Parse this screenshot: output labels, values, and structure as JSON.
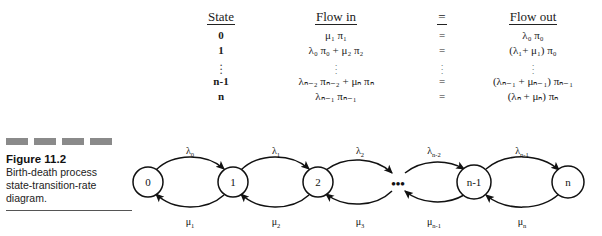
{
  "figure": {
    "number": "Figure 11.2",
    "caption_lines": [
      "Birth-death process",
      "state-transition-rate",
      "diagram."
    ],
    "dash_count": 4,
    "dash_color": "#8a8a8a"
  },
  "balance_table": {
    "headers": {
      "state": "State",
      "flow_in": "Flow in",
      "equals": "=",
      "flow_out": "Flow out"
    },
    "rows": [
      {
        "state": "0",
        "flow_in": "μ₁ π₁",
        "equals": "=",
        "flow_out": "λ₀ π₀"
      },
      {
        "state": "1",
        "flow_in": "λ₀ π₀ +  μ₂ π₂",
        "equals": "=",
        "flow_out": "(λ₁+ μ₁) π₀"
      },
      {
        "state": "⋮",
        "flow_in": "⋮",
        "equals": "⋮",
        "flow_out": "⋮"
      },
      {
        "state": "n-1",
        "flow_in": "λₙ₋₂ πₙ₋₂ + μₙ πₙ",
        "equals": "=",
        "flow_out": "(λₙ₋₁ + μₙ₋₁) πₙ₋₁"
      },
      {
        "state": "n",
        "flow_in": "λₙ₋₁ πₙ₋₁",
        "equals": "=",
        "flow_out": "(λₙ + μₙ) πₙ"
      }
    ]
  },
  "diagram": {
    "type": "state-transition-rate-diagram",
    "nodes": [
      {
        "id": "0",
        "label": "0",
        "cx": 28,
        "cy": 54,
        "r": 15
      },
      {
        "id": "1",
        "label": "1",
        "cx": 113,
        "cy": 54,
        "r": 15
      },
      {
        "id": "2",
        "label": "2",
        "cx": 198,
        "cy": 54,
        "r": 15
      },
      {
        "id": "n-1",
        "label": "n-1",
        "cx": 354,
        "cy": 54,
        "r": 17
      },
      {
        "id": "n",
        "label": "n",
        "cx": 448,
        "cy": 54,
        "r": 16
      }
    ],
    "ellipsis": {
      "label": "•••",
      "cx": 278,
      "cy": 56
    },
    "birth_rates": [
      {
        "label": "λ",
        "sub": "0",
        "from": "0",
        "to": "1",
        "lx": 70,
        "ly": 22
      },
      {
        "label": "λ",
        "sub": "1",
        "from": "1",
        "to": "2",
        "lx": 156,
        "ly": 22
      },
      {
        "label": "λ",
        "sub": "2",
        "from": "2",
        "to": "…",
        "lx": 240,
        "ly": 22
      },
      {
        "label": "λ",
        "sub": "n-2",
        "from": "…",
        "to": "n-1",
        "lx": 316,
        "ly": 22
      },
      {
        "label": "λ",
        "sub": "n-1",
        "from": "n-1",
        "to": "n",
        "lx": 402,
        "ly": 22
      }
    ],
    "death_rates": [
      {
        "label": "μ",
        "sub": "1",
        "from": "1",
        "to": "0",
        "lx": 70,
        "ly": 95
      },
      {
        "label": "μ",
        "sub": "2",
        "from": "2",
        "to": "1",
        "lx": 156,
        "ly": 95
      },
      {
        "label": "μ",
        "sub": "3",
        "from": "…",
        "to": "2",
        "lx": 240,
        "ly": 95
      },
      {
        "label": "μ",
        "sub": "n-1",
        "from": "n-1",
        "to": "…",
        "lx": 316,
        "ly": 95
      },
      {
        "label": "μ",
        "sub": "n",
        "from": "n",
        "to": "n-1",
        "lx": 402,
        "ly": 95
      }
    ],
    "stroke_color": "#111111"
  }
}
